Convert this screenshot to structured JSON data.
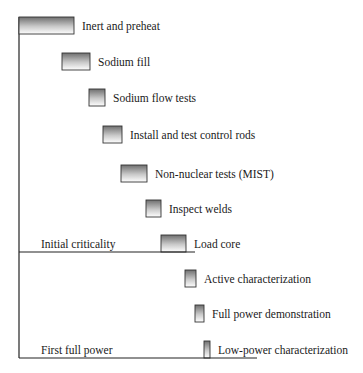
{
  "chart_data": {
    "type": "gantt",
    "title": "",
    "xlabel": "",
    "ylabel": "",
    "tasks": [
      {
        "label": "Inert and preheat",
        "start": 0,
        "end": 55
      },
      {
        "label": "Sodium fill",
        "start": 43,
        "end": 71
      },
      {
        "label": "Sodium flow tests",
        "start": 70,
        "end": 86
      },
      {
        "label": "Install and test control rods",
        "start": 84,
        "end": 103
      },
      {
        "label": "Non-nuclear tests (MIST)",
        "start": 102,
        "end": 128
      },
      {
        "label": "Inspect welds",
        "start": 127,
        "end": 142
      },
      {
        "label": "Load core",
        "start": 142,
        "end": 167
      },
      {
        "label": "Active characterization",
        "start": 166,
        "end": 177
      },
      {
        "label": "Full power demonstration",
        "start": 176,
        "end": 185
      },
      {
        "label": "Low-power characterization",
        "start": 185,
        "end": 191
      }
    ],
    "milestones": [
      {
        "label": "Initial criticality",
        "after_task": 7,
        "at": 176
      },
      {
        "label": "First full power",
        "after_task": 10,
        "at": 238
      }
    ],
    "xlim": [
      0,
      238
    ],
    "grid": false,
    "legend": "none",
    "bar_gradient": [
      "#6f6f6f",
      "#ffffff"
    ]
  }
}
